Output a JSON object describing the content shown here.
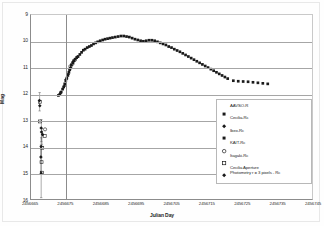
{
  "chart_data": {
    "type": "scatter",
    "title": "",
    "xlabel": "Julian Day",
    "ylabel": "Mag",
    "xlim": [
      2456665,
      2456745
    ],
    "ylim": [
      9,
      16
    ],
    "y_inverted": true,
    "grid": true,
    "legend_position": "right-inside",
    "xticks": [
      "2456665",
      "2456675",
      "2456685",
      "2456695",
      "2456705",
      "2456715",
      "2456725",
      "2456735",
      "2456745"
    ],
    "yticks": [
      "9",
      "10",
      "11",
      "12",
      "13",
      "14",
      "15",
      "16"
    ],
    "series": [
      {
        "name": "AAVSO-R",
        "marker": "filled-square",
        "color": "#1a1a1a",
        "points": [
          [
            2456673.2,
            12.02
          ],
          [
            2456673.6,
            11.93
          ],
          [
            2456674.0,
            11.82
          ],
          [
            2456674.3,
            11.74
          ],
          [
            2456674.6,
            11.62
          ],
          [
            2456674.9,
            11.5
          ],
          [
            2456675.2,
            11.4
          ],
          [
            2456675.5,
            11.3
          ],
          [
            2456675.8,
            11.18
          ],
          [
            2456676.1,
            11.05
          ],
          [
            2456676.5,
            10.9
          ],
          [
            2456676.9,
            10.82
          ],
          [
            2456677.2,
            10.74
          ],
          [
            2456677.6,
            10.68
          ],
          [
            2456678.0,
            10.62
          ],
          [
            2456678.4,
            10.58
          ],
          [
            2456678.9,
            10.5
          ],
          [
            2456679.4,
            10.42
          ],
          [
            2456679.9,
            10.34
          ],
          [
            2456680.4,
            10.3
          ],
          [
            2456681.0,
            10.24
          ],
          [
            2456681.6,
            10.2
          ],
          [
            2456682.2,
            10.16
          ],
          [
            2456682.8,
            10.1
          ],
          [
            2456683.4,
            10.06
          ],
          [
            2456684.0,
            10.02
          ],
          [
            2456684.7,
            9.98
          ],
          [
            2456685.4,
            9.95
          ],
          [
            2456686.1,
            9.92
          ],
          [
            2456686.8,
            9.9
          ],
          [
            2456687.5,
            9.88
          ],
          [
            2456688.2,
            9.86
          ],
          [
            2456689.0,
            9.84
          ],
          [
            2456689.8,
            9.82
          ],
          [
            2456690.6,
            9.8
          ],
          [
            2456691.4,
            9.8
          ],
          [
            2456692.2,
            9.82
          ],
          [
            2456693.0,
            9.84
          ],
          [
            2456693.8,
            9.88
          ],
          [
            2456694.6,
            9.92
          ],
          [
            2456695.4,
            9.95
          ],
          [
            2456696.2,
            9.98
          ],
          [
            2456697.0,
            10.0
          ],
          [
            2456697.8,
            9.98
          ],
          [
            2456698.6,
            9.96
          ],
          [
            2456699.4,
            9.96
          ],
          [
            2456700.2,
            9.98
          ],
          [
            2456701.0,
            10.02
          ],
          [
            2456701.8,
            10.06
          ],
          [
            2456702.6,
            10.1
          ],
          [
            2456703.4,
            10.14
          ],
          [
            2456704.2,
            10.2
          ],
          [
            2456705.0,
            10.24
          ],
          [
            2456705.8,
            10.3
          ],
          [
            2456706.6,
            10.35
          ],
          [
            2456707.4,
            10.4
          ],
          [
            2456708.2,
            10.46
          ],
          [
            2456709.0,
            10.52
          ],
          [
            2456709.8,
            10.58
          ],
          [
            2456710.6,
            10.64
          ],
          [
            2456711.4,
            10.7
          ],
          [
            2456712.2,
            10.76
          ],
          [
            2456713.0,
            10.82
          ],
          [
            2456713.8,
            10.88
          ],
          [
            2456714.6,
            10.94
          ],
          [
            2456715.4,
            11.0
          ],
          [
            2456716.2,
            11.06
          ],
          [
            2456717.0,
            11.12
          ],
          [
            2456717.8,
            11.18
          ],
          [
            2456718.6,
            11.24
          ],
          [
            2456719.4,
            11.3
          ],
          [
            2456720.2,
            11.36
          ],
          [
            2456721.0,
            11.42
          ],
          [
            2456722.6,
            11.5
          ],
          [
            2456724.0,
            11.52
          ],
          [
            2456725.4,
            11.53
          ],
          [
            2456726.8,
            11.54
          ],
          [
            2456728.2,
            11.56
          ],
          [
            2456729.6,
            11.58
          ],
          [
            2456731.0,
            11.6
          ],
          [
            2456732.4,
            11.62
          ]
        ]
      },
      {
        "name": "Cecilia-Rc",
        "marker": "filled-diamond",
        "color": "#1a1a1a",
        "points": [
          [
            2456674.5,
            11.7
          ],
          [
            2456675.0,
            11.45
          ],
          [
            2456675.6,
            11.25
          ],
          [
            2456676.3,
            11.0
          ],
          [
            2456677.0,
            10.78
          ],
          [
            2456678.2,
            10.6
          ]
        ]
      },
      {
        "name": "Ibex-Rc",
        "marker": "filled-square",
        "color": "#1a1a1a",
        "points": [
          [
            2456672.8,
            12.06
          ],
          [
            2456673.4,
            11.96
          ],
          [
            2456676.0,
            11.08
          ]
        ]
      },
      {
        "name": "KAIT-Rc",
        "marker": "open-circle",
        "color": "#1a1a1a",
        "points": [
          [
            2456676.2,
            10.95
          ],
          [
            2456676.8,
            10.86
          ],
          [
            2456677.4,
            10.72
          ],
          [
            2456669.0,
            13.35
          ]
        ]
      },
      {
        "name": "Itagaki-Rc",
        "marker": "open-square",
        "color": "#1a1a1a",
        "points": [
          [
            2456667.5,
            12.3
          ],
          [
            2456667.6,
            13.05
          ],
          [
            2456668.9,
            13.6
          ],
          [
            2456668.2,
            14.05
          ],
          [
            2456668.0,
            14.6
          ],
          [
            2456668.1,
            15.0
          ]
        ]
      },
      {
        "name": "Cecilia Aperture\nPhotometry r = 3 pixels - Rc",
        "marker": "filled-diamond",
        "color": "#1a1a1a",
        "points": [
          [
            2456667.4,
            12.25
          ],
          [
            2456667.5,
            12.45
          ],
          [
            2456667.9,
            13.3
          ],
          [
            2456668.0,
            13.45
          ],
          [
            2456668.3,
            13.55
          ],
          [
            2456667.9,
            14.0
          ],
          [
            2456667.8,
            14.4
          ],
          [
            2456667.9,
            15.02
          ]
        ]
      }
    ],
    "error_bars": [
      {
        "x": 2456667.45,
        "y": 12.3,
        "err": 0.35
      },
      {
        "x": 2456667.95,
        "y": 13.4,
        "err": 0.42
      },
      {
        "x": 2456668.1,
        "y": 13.62,
        "err": 0.3
      },
      {
        "x": 2456667.9,
        "y": 14.05,
        "err": 0.38
      },
      {
        "x": 2456667.85,
        "y": 14.45,
        "err": 0.5
      },
      {
        "x": 2456667.9,
        "y": 15.0,
        "err": 0.95
      }
    ]
  },
  "legend": {
    "items": [
      {
        "label": "AAVSO-R",
        "marker": "filled-square"
      },
      {
        "label": "Cecilia-Rc",
        "marker": "filled-diamond"
      },
      {
        "label": "Ibex-Rc",
        "marker": "filled-square"
      },
      {
        "label": "KAIT-Rc",
        "marker": "open-circle"
      },
      {
        "label": "Itagaki-Rc",
        "marker": "open-square"
      },
      {
        "label": "Cecilia Aperture\nPhotometry r = 3 pixels - Rc",
        "marker": "filled-diamond"
      }
    ]
  },
  "axis": {
    "x_title": "Julian Day",
    "y_title": "Mag"
  }
}
